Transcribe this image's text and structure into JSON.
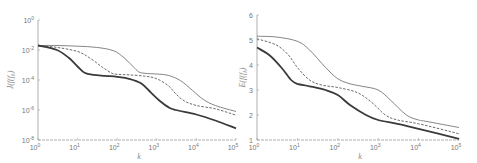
{
  "chart_data": [
    {
      "type": "line",
      "xscale": "log",
      "yscale": "log",
      "xlabel": "k",
      "ylabel": "J(f_k)",
      "xlim": [
        1,
        100000
      ],
      "ylim": [
        1e-08,
        1
      ],
      "xticks": [
        {
          "v": 1,
          "b": "10",
          "e": "0"
        },
        {
          "v": 10,
          "b": "10",
          "e": "1"
        },
        {
          "v": 100,
          "b": "10",
          "e": "2"
        },
        {
          "v": 1000,
          "b": "10",
          "e": "3"
        },
        {
          "v": 10000,
          "b": "10",
          "e": "4"
        },
        {
          "v": 100000,
          "b": "10",
          "e": "5"
        }
      ],
      "yticks": [
        {
          "v": 1,
          "b": "10",
          "e": "0"
        },
        {
          "v": 0.01,
          "b": "10",
          "e": "-2"
        },
        {
          "v": 0.0001,
          "b": "10",
          "e": "-4"
        },
        {
          "v": 1e-06,
          "b": "10",
          "e": "-6"
        },
        {
          "v": 1e-08,
          "b": "10",
          "e": "-8"
        }
      ],
      "grid": false,
      "series": [
        {
          "name": "thin-solid",
          "style": "solid-thin",
          "x": [
            1,
            3,
            10,
            30,
            80,
            150,
            250,
            350,
            500,
            1000,
            2000,
            4000,
            8000,
            15000,
            30000,
            100000
          ],
          "y": [
            0.02,
            0.02,
            0.018,
            0.015,
            0.009,
            0.003,
            0.0008,
            0.00035,
            0.00028,
            0.00025,
            0.0002,
            9e-05,
            2e-05,
            5e-06,
            2e-06,
            8e-07
          ]
        },
        {
          "name": "dashed",
          "style": "dashed",
          "x": [
            1,
            3,
            10,
            20,
            40,
            70,
            100,
            200,
            500,
            1000,
            2000,
            3000,
            5000,
            10000,
            30000,
            100000
          ],
          "y": [
            0.02,
            0.015,
            0.008,
            0.003,
            0.0008,
            0.0003,
            0.00024,
            0.00022,
            0.00018,
            0.00012,
            4e-05,
            1.2e-05,
            4e-06,
            2e-06,
            1.2e-06,
            4.5e-07
          ]
        },
        {
          "name": "thick-solid",
          "style": "solid-thick",
          "x": [
            1,
            3,
            6,
            10,
            15,
            25,
            50,
            100,
            200,
            400,
            700,
            1200,
            2000,
            3000,
            10000,
            30000,
            100000
          ],
          "y": [
            0.02,
            0.01,
            0.003,
            0.0008,
            0.0003,
            0.00022,
            0.00019,
            0.00016,
            0.00012,
            6e-05,
            1.5e-05,
            4e-06,
            1.5e-06,
            1e-06,
            5e-07,
            2e-07,
            6e-08
          ]
        }
      ]
    },
    {
      "type": "line",
      "xscale": "log",
      "yscale": "linear",
      "xlabel": "k",
      "ylabel": "E(f_k)",
      "xlim": [
        1,
        100000
      ],
      "ylim": [
        1,
        6
      ],
      "xticks": [
        {
          "v": 1,
          "b": "10",
          "e": "0"
        },
        {
          "v": 10,
          "b": "10",
          "e": "1"
        },
        {
          "v": 100,
          "b": "10",
          "e": "2"
        },
        {
          "v": 1000,
          "b": "10",
          "e": "3"
        },
        {
          "v": 10000,
          "b": "10",
          "e": "4"
        },
        {
          "v": 100000,
          "b": "10",
          "e": "5"
        }
      ],
      "yticks": [
        {
          "v": 1,
          "b": "1",
          "e": ""
        },
        {
          "v": 2,
          "b": "2",
          "e": ""
        },
        {
          "v": 3,
          "b": "3",
          "e": ""
        },
        {
          "v": 4,
          "b": "4",
          "e": ""
        },
        {
          "v": 5,
          "b": "5",
          "e": ""
        },
        {
          "v": 6,
          "b": "6",
          "e": ""
        }
      ],
      "grid": false,
      "series": [
        {
          "name": "thin-solid",
          "style": "solid-thin",
          "x": [
            1,
            3,
            10,
            20,
            50,
            100,
            200,
            400,
            1000,
            2000,
            5000,
            10000,
            15000,
            100000
          ],
          "y": [
            5.15,
            5.12,
            4.95,
            4.6,
            3.9,
            3.45,
            3.25,
            3.15,
            3.0,
            2.6,
            2.0,
            1.8,
            1.75,
            1.5
          ]
        },
        {
          "name": "dashed",
          "style": "dashed",
          "x": [
            1,
            3,
            6,
            10,
            20,
            40,
            100,
            300,
            700,
            1500,
            3000,
            10000,
            100000
          ],
          "y": [
            5.05,
            4.8,
            4.4,
            3.9,
            3.4,
            3.2,
            3.1,
            2.9,
            2.5,
            2.0,
            1.8,
            1.65,
            1.25
          ]
        },
        {
          "name": "thick-solid",
          "style": "solid-thick",
          "x": [
            1,
            2,
            4,
            7,
            10,
            20,
            50,
            100,
            200,
            500,
            1000,
            3000,
            10000,
            100000
          ],
          "y": [
            4.7,
            4.4,
            3.9,
            3.4,
            3.25,
            3.15,
            3.0,
            2.8,
            2.4,
            2.0,
            1.8,
            1.65,
            1.45,
            1.05
          ]
        }
      ]
    }
  ]
}
